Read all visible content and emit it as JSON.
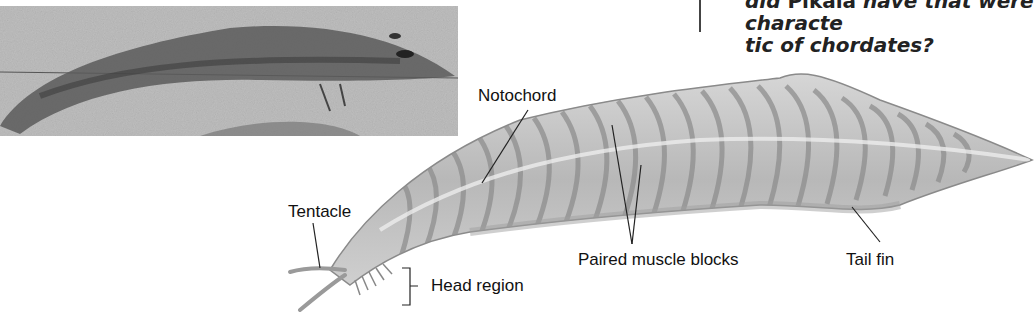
{
  "figure": {
    "question": {
      "line1_prefix": "did ",
      "line1_name": "Pikaia",
      "line1_suffix": " have that were characte",
      "line2": "tic of chordates?"
    },
    "photo": {
      "description": "Fossil of Pikaia",
      "tone": "grayscale"
    },
    "illustration": {
      "description": "Reconstruction of Pikaia showing chordate features",
      "labels": {
        "notochord": "Notochord",
        "tentacle": "Tentacle",
        "head_region": "Head region",
        "paired_muscle_blocks": "Paired muscle blocks",
        "tail_fin": "Tail fin"
      }
    },
    "colors": {
      "body_fill": "#c4c4c4",
      "body_stroke": "#8a8a8a",
      "fossil_bg": "#c9c9c9",
      "fossil_body": "#5a5a5a",
      "label_text": "#111111"
    }
  }
}
